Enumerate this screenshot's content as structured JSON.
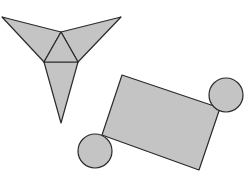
{
  "diagram": {
    "colors": {
      "fill": "#c4c4c4",
      "stroke": "#2a2a2a",
      "background": "#ffffff"
    },
    "triangle_net": {
      "label": "tetrahedron net",
      "center_triangle": [
        [
          61,
          32
        ],
        [
          44,
          62
        ],
        [
          78,
          62
        ]
      ],
      "flaps": [
        {
          "name": "left-flap",
          "points": [
            [
              2,
              17
            ],
            [
              61,
              32
            ],
            [
              44,
              62
            ]
          ]
        },
        {
          "name": "right-flap",
          "points": [
            [
              121,
              17
            ],
            [
              61,
              32
            ],
            [
              78,
              62
            ]
          ]
        },
        {
          "name": "bottom-flap",
          "points": [
            [
              44,
              62
            ],
            [
              78,
              62
            ],
            [
              61,
              123
            ]
          ]
        }
      ]
    },
    "cylinder_net": {
      "label": "cylinder net",
      "rectangle": [
        [
          122,
          75
        ],
        [
          220,
          108
        ],
        [
          199,
          170
        ],
        [
          102,
          135
        ]
      ],
      "circles": [
        {
          "name": "top-circle",
          "cx": 226,
          "cy": 95,
          "r": 17
        },
        {
          "name": "bottom-circle",
          "cx": 95,
          "cy": 151,
          "r": 17
        }
      ]
    }
  }
}
